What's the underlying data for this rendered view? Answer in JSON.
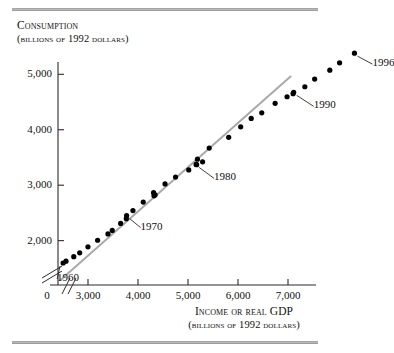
{
  "figure": {
    "top_rule": "horizontal-rule",
    "bottom_rule": "horizontal-rule"
  },
  "chart_data": {
    "type": "scatter",
    "title": "",
    "ylabel": "Consumption",
    "ylabel_units": "(billions of 1992 dollars)",
    "xlabel": "Income or real GDP",
    "xlabel_units": "(billions of 1992 dollars)",
    "xlim": [
      2400,
      7400
    ],
    "ylim": [
      1200,
      5150
    ],
    "x_break": true,
    "y_break": true,
    "grid": false,
    "legend": null,
    "x_ticks": [
      0,
      3000,
      4000,
      5000,
      6000,
      7000
    ],
    "x_tick_labels": [
      "0",
      "3,000",
      "4,000",
      "5,000",
      "6,000",
      "7,000"
    ],
    "y_ticks": [
      2000,
      3000,
      4000,
      5000
    ],
    "y_tick_labels": [
      "2,000",
      "3,000",
      "4,000",
      "5,000"
    ],
    "trend_line": {
      "style": "solid-gray",
      "x_start": 2450,
      "y_start": 1290,
      "x_end": 7050,
      "y_end": 4960
    },
    "series": [
      {
        "name": "Consumption vs Income",
        "marker": "filled-circle",
        "color": "#000000",
        "points": [
          {
            "year": 1960,
            "x": 2502,
            "y": 1597
          },
          {
            "year": 1961,
            "x": 2560,
            "y": 1630
          },
          {
            "year": 1962,
            "x": 2715,
            "y": 1711
          },
          {
            "year": 1963,
            "x": 2834,
            "y": 1781
          },
          {
            "year": 1964,
            "x": 2999,
            "y": 1888
          },
          {
            "year": 1965,
            "x": 3192,
            "y": 2007
          },
          {
            "year": 1966,
            "x": 3399,
            "y": 2122
          },
          {
            "year": 1967,
            "x": 3485,
            "y": 2185
          },
          {
            "year": 1968,
            "x": 3653,
            "y": 2310
          },
          {
            "year": 1969,
            "x": 3766,
            "y": 2396
          },
          {
            "year": 1970,
            "x": 3772,
            "y": 2452
          },
          {
            "year": 1971,
            "x": 3899,
            "y": 2543
          },
          {
            "year": 1972,
            "x": 4105,
            "y": 2696
          },
          {
            "year": 1973,
            "x": 4342,
            "y": 2826
          },
          {
            "year": 1974,
            "x": 4320,
            "y": 2808
          },
          {
            "year": 1975,
            "x": 4311,
            "y": 2865
          },
          {
            "year": 1976,
            "x": 4541,
            "y": 3023
          },
          {
            "year": 1977,
            "x": 4751,
            "y": 3146
          },
          {
            "year": 1978,
            "x": 5015,
            "y": 3276
          },
          {
            "year": 1979,
            "x": 5173,
            "y": 3371
          },
          {
            "year": 1980,
            "x": 5162,
            "y": 3375
          },
          {
            "year": 1981,
            "x": 5292,
            "y": 3422
          },
          {
            "year": 1982,
            "x": 5189,
            "y": 3470
          },
          {
            "year": 1983,
            "x": 5424,
            "y": 3669
          },
          {
            "year": 1984,
            "x": 5814,
            "y": 3864
          },
          {
            "year": 1985,
            "x": 6054,
            "y": 4053
          },
          {
            "year": 1986,
            "x": 6264,
            "y": 4204
          },
          {
            "year": 1987,
            "x": 6475,
            "y": 4305
          },
          {
            "year": 1988,
            "x": 6743,
            "y": 4477
          },
          {
            "year": 1989,
            "x": 6981,
            "y": 4595
          },
          {
            "year": 1990,
            "x": 7113,
            "y": 4675
          },
          {
            "year": 1991,
            "x": 7101,
            "y": 4651
          },
          {
            "year": 1992,
            "x": 7337,
            "y": 4776
          },
          {
            "year": 1993,
            "x": 7533,
            "y": 4914
          },
          {
            "year": 1994,
            "x": 7836,
            "y": 5075
          },
          {
            "year": 1995,
            "x": 8032,
            "y": 5208
          },
          {
            "year": 1996,
            "x": 8329,
            "y": 5382
          }
        ]
      }
    ],
    "annotations": [
      {
        "label": "1960",
        "points_to_year": 1960
      },
      {
        "label": "1970",
        "points_to_year": 1970
      },
      {
        "label": "1980",
        "points_to_year": 1980
      },
      {
        "label": "1990",
        "points_to_year": 1990
      },
      {
        "label": "1996",
        "points_to_year": 1996
      }
    ]
  }
}
